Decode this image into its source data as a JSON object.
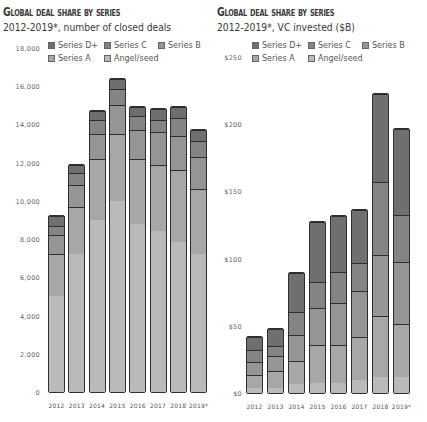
{
  "colors": {
    "Series D+": "#6f6f6f",
    "Series C": "#848484",
    "Series B": "#959595",
    "Series A": "#a7a7a7",
    "Angel/seed": "#bababa",
    "outline": "#2e2e2e"
  },
  "legend": [
    {
      "label": "Series D+",
      "key": "Series D+"
    },
    {
      "label": "Series C",
      "key": "Series C"
    },
    {
      "label": "Series B",
      "key": "Series B"
    },
    {
      "label": "Series A",
      "key": "Series A"
    },
    {
      "label": "Angel/seed",
      "key": "Angel/seed"
    }
  ],
  "left": {
    "title": "Global deal share by series",
    "subtitle": "2012-2019*, number of closed deals",
    "yticks": [
      "0",
      "2,000",
      "4,000",
      "6,000",
      "8,000",
      "10,000",
      "12,000",
      "14,000",
      "16,000",
      "18,000"
    ]
  },
  "right": {
    "title": "Global deal share by series",
    "subtitle": "2012-2019*, VC invested ($B)",
    "yticks": [
      "$0",
      "$50",
      "$100",
      "$150",
      "$200",
      "$250"
    ]
  },
  "chart_data": [
    {
      "type": "bar",
      "stacked": true,
      "title": "Global deal share by series",
      "subtitle": "2012-2019*, number of closed deals",
      "xlabel": "",
      "ylabel": "",
      "ylim": [
        0,
        18000
      ],
      "yticks": [
        0,
        2000,
        4000,
        6000,
        8000,
        10000,
        12000,
        14000,
        16000,
        18000
      ],
      "grid": false,
      "legend_position": "top",
      "categories": [
        "2012",
        "2013",
        "2014",
        "2015",
        "2016",
        "2017",
        "2018",
        "2019*"
      ],
      "series": [
        {
          "name": "Angel/seed",
          "values": [
            5200,
            7400,
            9200,
            10200,
            9000,
            8600,
            8000,
            7400
          ]
        },
        {
          "name": "Series A",
          "values": [
            2200,
            2500,
            3200,
            3500,
            3400,
            3500,
            3800,
            3400
          ]
        },
        {
          "name": "Series B",
          "values": [
            1000,
            1100,
            1300,
            1500,
            1500,
            1700,
            1800,
            1700
          ]
        },
        {
          "name": "Series C",
          "values": [
            450,
            600,
            700,
            800,
            700,
            600,
            900,
            800
          ]
        },
        {
          "name": "Series D+",
          "values": [
            450,
            400,
            400,
            500,
            400,
            500,
            500,
            500
          ]
        }
      ]
    },
    {
      "type": "bar",
      "stacked": true,
      "title": "Global deal share by series",
      "subtitle": "2012-2019*, VC invested ($B)",
      "xlabel": "",
      "ylabel": "",
      "ylim": [
        0,
        250
      ],
      "yticks": [
        0,
        50,
        100,
        150,
        200,
        250
      ],
      "grid": false,
      "legend_position": "top",
      "categories": [
        "2012",
        "2013",
        "2014",
        "2015",
        "2016",
        "2017",
        "2018",
        "2019*"
      ],
      "series": [
        {
          "name": "Angel/seed",
          "values": [
            4,
            4,
            7,
            8,
            8,
            10,
            12,
            12
          ]
        },
        {
          "name": "Series A",
          "values": [
            10,
            13,
            17,
            28,
            28,
            32,
            46,
            40
          ]
        },
        {
          "name": "Series B",
          "values": [
            10,
            12,
            20,
            28,
            32,
            35,
            45,
            46
          ]
        },
        {
          "name": "Series C",
          "values": [
            9,
            7,
            17,
            19,
            23,
            21,
            55,
            35
          ]
        },
        {
          "name": "Series D+",
          "values": [
            10,
            13,
            30,
            46,
            42,
            40,
            66,
            65
          ]
        }
      ]
    }
  ]
}
